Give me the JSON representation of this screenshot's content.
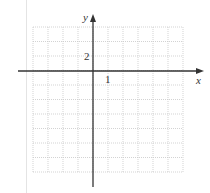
{
  "diagram": {
    "type": "coordinate_grid",
    "axes": {
      "x_label": "x",
      "y_label": "y",
      "x_tick_label": "1",
      "y_tick_label": "2"
    },
    "grid": {
      "columns": 10,
      "rows": 10,
      "columns_left_of_y_axis": 4,
      "rows_above_x_axis": 3,
      "x_units_per_cell": 1,
      "y_units_per_cell": 2
    },
    "colors": {
      "axis": "#333333",
      "grid": "#c8c8c8",
      "text": "#333333"
    }
  }
}
